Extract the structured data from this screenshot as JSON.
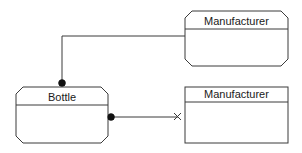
{
  "diagram": {
    "type": "entity-relationship",
    "entities": [
      {
        "id": "manufacturer-top",
        "label": "Manufacturer",
        "shape": "octagon"
      },
      {
        "id": "bottle",
        "label": "Bottle",
        "shape": "octagon"
      },
      {
        "id": "manufacturer-bottom",
        "label": "Manufacturer",
        "shape": "rectangle"
      }
    ],
    "relationships": [
      {
        "from": "bottle",
        "to": "manufacturer-top",
        "from_end": "filled-dot",
        "to_end": "none"
      },
      {
        "from": "bottle",
        "to": "manufacturer-bottom",
        "from_end": "filled-dot",
        "to_end": "x-mark"
      }
    ],
    "colors": {
      "stroke": "#3a3a3a",
      "background": "#ffffff",
      "text": "#1a1a1a"
    }
  }
}
